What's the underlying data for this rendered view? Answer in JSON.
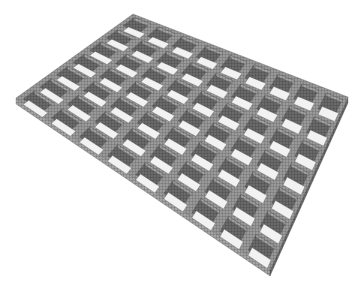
{
  "image": {
    "description": "3D rendered cellular grid mesh structure viewed in perspective",
    "width": 364,
    "height": 285,
    "background": "#ffffff"
  },
  "structure": {
    "cols": 9,
    "rows": 7,
    "corners": {
      "left": [
        16,
        98
      ],
      "top": [
        133,
        14
      ],
      "right": [
        348,
        97
      ],
      "bottom": [
        270,
        270
      ]
    },
    "colors": {
      "top_face": "#9a9a9a",
      "wall_dark": "#5e5e5e",
      "wall_mid": "#8a8a8a",
      "floor_light": "#f2f2f2",
      "mesh_line": "#4a4a4a"
    }
  }
}
